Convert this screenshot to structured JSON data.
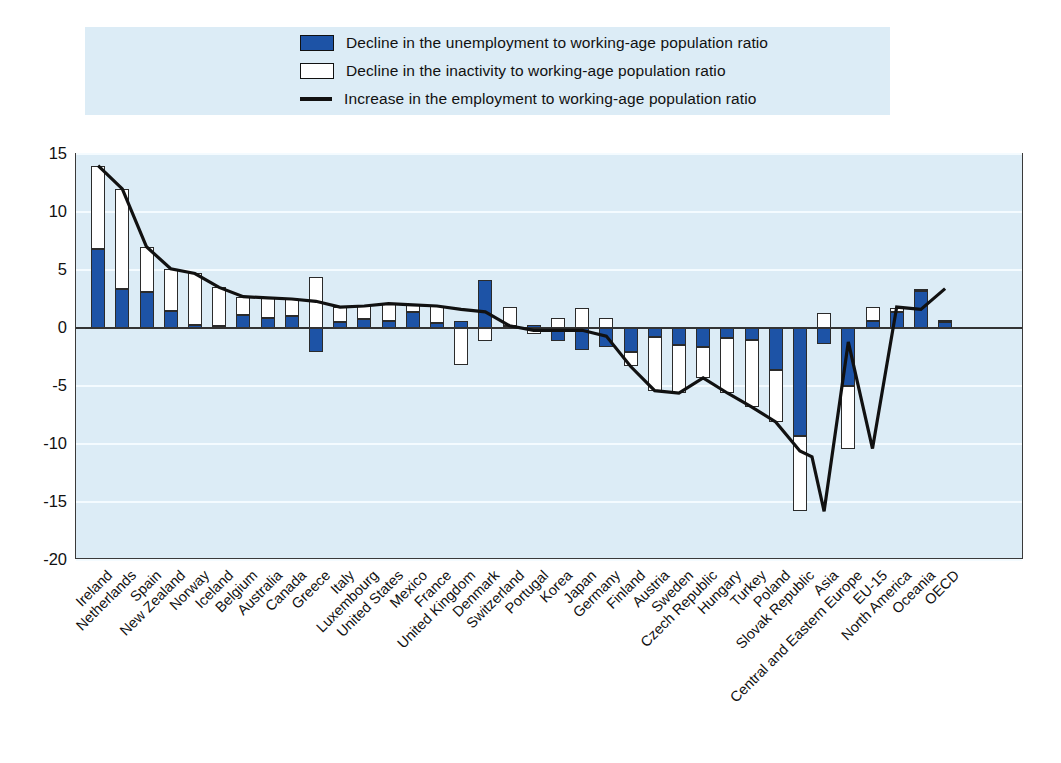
{
  "legend": {
    "items": [
      {
        "marker": "blue-square-icon",
        "label": "Decline in the unemployment to working-age population ratio"
      },
      {
        "marker": "white-square-icon",
        "label": "Decline in the inactivity to working-age population ratio"
      },
      {
        "marker": "black-line-icon",
        "label": "Increase in the employment to working-age population ratio"
      }
    ],
    "background": "#dcecf6"
  },
  "colors": {
    "unemployment_bar": "#1d53a6",
    "inactivity_bar": "#ffffff",
    "employment_line": "#111111",
    "plot_background": "#dcecf6",
    "gridline": "#f4fbff",
    "axis": "#333333"
  },
  "chart_data": {
    "type": "bar",
    "title": "",
    "subtitle": "",
    "xlabel": "",
    "ylabel": "",
    "ylim": [
      -20,
      15
    ],
    "yticks": [
      15,
      10,
      5,
      0,
      -5,
      -10,
      -15,
      -20
    ],
    "ytick_labels": [
      "15",
      "10",
      "5",
      "0",
      "-5",
      "-10",
      "-15",
      "-20"
    ],
    "grid": true,
    "legend_position": "top",
    "stacked": true,
    "categories": [
      "Ireland",
      "Netherlands",
      "Spain",
      "New Zealand",
      "Norway",
      "Iceland",
      "Belgium",
      "Australia",
      "Canada",
      "Greece",
      "Italy",
      "Luxembourg",
      "United States",
      "Mexico",
      "France",
      "United Kingdom",
      "Denmark",
      "Switzerland",
      "Portugal",
      "Korea",
      "Japan",
      "Germany",
      "Finland",
      "Austria",
      "Sweden",
      "Czech Republic",
      "Hungary",
      "Turkey",
      "Poland",
      "Slovak Republic",
      "Asia",
      "Central and Eastern Europe",
      "EU-15",
      "North America",
      "Oceania",
      "OECD"
    ],
    "series": [
      {
        "name": "Decline in the unemployment to working-age population ratio",
        "color": "#1d53a6",
        "values": [
          6.8,
          3.4,
          3.1,
          1.5,
          0.3,
          0.2,
          1.1,
          0.9,
          1.0,
          -2.1,
          0.5,
          0.8,
          0.6,
          1.4,
          0.4,
          0.6,
          4.1,
          0.2,
          0.3,
          -1.1,
          -1.9,
          -1.6,
          -2.1,
          -0.8,
          -1.5,
          -1.6,
          -0.9,
          -1.0,
          -3.6,
          -9.3,
          -1.4,
          -5.0,
          0.6,
          1.4,
          3.2,
          0.5
        ]
      },
      {
        "name": "Decline in the inactivity to working-age population ratio",
        "color": "#ffffff",
        "values": [
          7.2,
          8.6,
          3.9,
          3.6,
          4.4,
          3.3,
          1.6,
          1.7,
          1.5,
          4.4,
          1.3,
          1.1,
          1.5,
          0.6,
          1.5,
          -3.2,
          -1.1,
          1.6,
          -0.5,
          0.9,
          1.7,
          0.9,
          -1.2,
          -4.6,
          -4.1,
          -2.7,
          -4.7,
          -5.8,
          -4.5,
          -6.5,
          1.3,
          -5.4,
          1.2,
          0.3,
          0.2,
          0.2
        ]
      }
    ],
    "line_series": {
      "name": "Increase in the employment to working-age population ratio",
      "color": "#111111",
      "values": [
        14.0,
        12.0,
        7.0,
        5.1,
        4.7,
        3.5,
        2.7,
        2.6,
        2.5,
        2.3,
        1.8,
        1.9,
        2.1,
        2.0,
        1.9,
        1.6,
        1.4,
        0.2,
        -0.2,
        -0.2,
        -0.2,
        -0.7,
        -3.3,
        -5.4,
        -5.6,
        -4.3,
        -5.6,
        -6.8,
        -8.1,
        -10.6,
        -11.1,
        -15.8,
        -1.2,
        -10.4,
        1.8,
        1.6,
        3.4,
        0.7
      ]
    }
  }
}
